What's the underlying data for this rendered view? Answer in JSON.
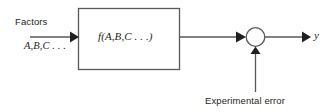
{
  "diagram": {
    "background_color": "#ffffff",
    "stroke_color": "#58595b",
    "text_color": "#231f20",
    "labels": {
      "factors": "Factors",
      "factor_list": "A,B,C . . .",
      "function": "f(A,B,C . . .)",
      "output": "y",
      "experimental_error": "Experimental error"
    },
    "nodes": {
      "process_box": {
        "x": 78,
        "y": 8,
        "width": 102,
        "height": 62
      },
      "summing_junction": {
        "cx": 255.5,
        "cy": 37,
        "r": 9.5
      }
    },
    "connectors": [
      {
        "name": "factors-input-arrow",
        "from_x": 30,
        "from_y": 37,
        "to_x": 78,
        "to_y": 37,
        "arrowhead": "end"
      },
      {
        "name": "process-to-junction-arrow",
        "from_x": 180,
        "from_y": 37,
        "to_x": 246,
        "to_y": 37,
        "arrowhead": "end"
      },
      {
        "name": "junction-to-output-arrow",
        "from_x": 265,
        "from_y": 37,
        "to_x": 311,
        "to_y": 37,
        "arrowhead": "end"
      },
      {
        "name": "error-input-arrow",
        "from_x": 255.5,
        "from_y": 92,
        "to_x": 255.5,
        "to_y": 47,
        "arrowhead": "end"
      }
    ]
  }
}
